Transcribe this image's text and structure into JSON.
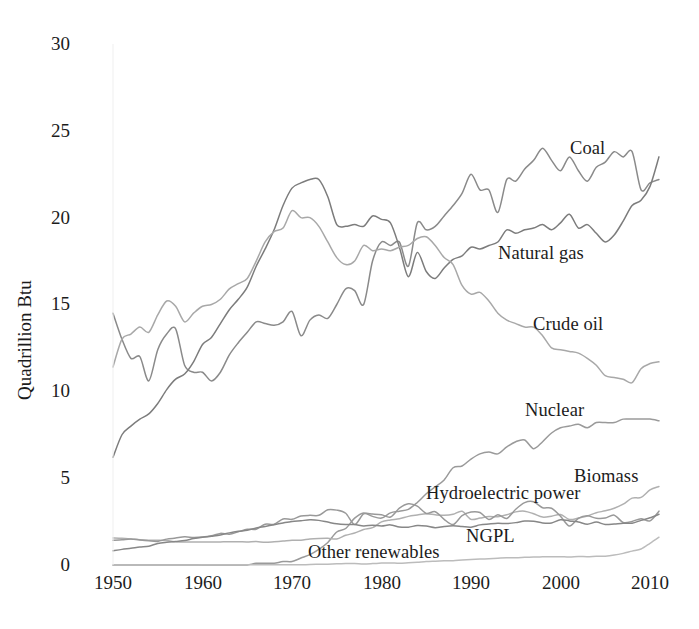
{
  "chart_data": {
    "type": "line",
    "title": "",
    "xlabel": "",
    "ylabel": "Quadrillion Btu",
    "xlim": [
      1950,
      2011
    ],
    "ylim": [
      0,
      30
    ],
    "xticks": [
      1950,
      1960,
      1970,
      1980,
      1990,
      2000,
      2010
    ],
    "yticks": [
      0,
      5,
      10,
      15,
      20,
      25,
      30
    ],
    "grid": false,
    "legend_position": "inline-annotations",
    "x": [
      1950,
      1951,
      1952,
      1953,
      1954,
      1955,
      1956,
      1957,
      1958,
      1959,
      1960,
      1961,
      1962,
      1963,
      1964,
      1965,
      1966,
      1967,
      1968,
      1969,
      1970,
      1971,
      1972,
      1973,
      1974,
      1975,
      1976,
      1977,
      1978,
      1979,
      1980,
      1981,
      1982,
      1983,
      1984,
      1985,
      1986,
      1987,
      1988,
      1989,
      1990,
      1991,
      1992,
      1993,
      1994,
      1995,
      1996,
      1997,
      1998,
      1999,
      2000,
      2001,
      2002,
      2003,
      2004,
      2005,
      2006,
      2007,
      2008,
      2009,
      2010,
      2011
    ],
    "series": [
      {
        "name": "Coal",
        "color": "#8a8a8a",
        "label_x": 1996,
        "label_y": 24.2,
        "values": [
          14.5,
          13.0,
          11.9,
          12.0,
          10.6,
          12.4,
          13.3,
          13.6,
          11.5,
          11.1,
          11.1,
          10.6,
          11.1,
          12.1,
          12.8,
          13.4,
          14.0,
          13.9,
          13.8,
          14.0,
          14.6,
          13.2,
          14.1,
          14.4,
          14.2,
          15.0,
          15.9,
          15.8,
          15.0,
          17.5,
          18.6,
          18.4,
          18.6,
          17.2,
          19.7,
          19.3,
          19.5,
          20.1,
          20.7,
          21.4,
          22.5,
          21.6,
          21.6,
          20.3,
          22.2,
          22.1,
          22.8,
          23.3,
          24.0,
          23.3,
          22.7,
          23.5,
          22.7,
          22.1,
          22.9,
          23.2,
          23.8,
          23.5,
          23.8,
          21.6,
          22.0,
          22.2
        ]
      },
      {
        "name": "Natural gas",
        "color": "#7c7c7c",
        "label_x": 1993,
        "label_y": 19.0,
        "values": [
          6.2,
          7.5,
          8.0,
          8.4,
          8.7,
          9.3,
          10.1,
          10.7,
          11.0,
          11.7,
          12.7,
          13.1,
          13.9,
          14.7,
          15.3,
          16.0,
          17.2,
          18.2,
          19.3,
          20.7,
          21.7,
          22.0,
          22.2,
          22.2,
          21.2,
          19.6,
          19.5,
          19.6,
          19.5,
          20.1,
          19.9,
          19.7,
          18.3,
          16.6,
          18.0,
          16.9,
          16.5,
          17.1,
          17.6,
          17.8,
          18.3,
          18.2,
          18.4,
          18.6,
          19.3,
          19.1,
          19.3,
          19.4,
          19.6,
          19.3,
          19.7,
          20.2,
          19.4,
          19.6,
          19.1,
          18.6,
          19.0,
          19.8,
          20.7,
          21.0,
          21.8,
          23.5
        ]
      },
      {
        "name": "Crude oil",
        "color": "#a8a8a8",
        "label_x": 1992,
        "label_y": 13.5,
        "values": [
          11.4,
          13.0,
          13.3,
          13.7,
          13.4,
          14.4,
          15.2,
          14.9,
          14.0,
          14.5,
          14.9,
          15.0,
          15.3,
          15.9,
          16.2,
          16.5,
          17.5,
          18.6,
          19.2,
          19.4,
          20.4,
          20.0,
          20.0,
          19.5,
          18.6,
          17.7,
          17.3,
          17.5,
          18.4,
          18.1,
          18.2,
          18.1,
          18.3,
          18.4,
          18.8,
          18.9,
          18.4,
          17.7,
          17.3,
          16.1,
          15.6,
          15.7,
          15.2,
          14.5,
          14.1,
          13.9,
          13.7,
          13.7,
          13.2,
          12.5,
          12.4,
          12.3,
          12.2,
          11.9,
          11.5,
          10.9,
          10.8,
          10.7,
          10.5,
          11.3,
          11.6,
          11.7
        ]
      },
      {
        "name": "Nuclear",
        "color": "#9a9a9a",
        "label_x": 1991,
        "label_y": 9.5,
        "values": [
          0.0,
          0.0,
          0.0,
          0.0,
          0.0,
          0.0,
          0.0,
          0.0,
          0.0,
          0.0,
          0.0,
          0.0,
          0.0,
          0.0,
          0.0,
          0.0,
          0.1,
          0.1,
          0.1,
          0.2,
          0.2,
          0.4,
          0.6,
          0.9,
          1.3,
          1.9,
          2.1,
          2.7,
          3.0,
          2.8,
          2.7,
          3.0,
          3.1,
          3.2,
          3.6,
          4.1,
          4.5,
          4.9,
          5.6,
          5.7,
          6.1,
          6.4,
          6.5,
          6.4,
          6.8,
          7.1,
          7.2,
          6.7,
          7.1,
          7.6,
          7.9,
          8.0,
          8.1,
          7.9,
          8.2,
          8.2,
          8.2,
          8.4,
          8.4,
          8.4,
          8.4,
          8.3
        ]
      },
      {
        "name": "Biomass",
        "color": "#b0b0b0",
        "label_x": 2001,
        "label_y": 5.4,
        "values": [
          1.56,
          1.54,
          1.5,
          1.45,
          1.42,
          1.42,
          1.41,
          1.34,
          1.32,
          1.32,
          1.32,
          1.32,
          1.33,
          1.34,
          1.34,
          1.33,
          1.35,
          1.31,
          1.34,
          1.38,
          1.43,
          1.43,
          1.5,
          1.53,
          1.54,
          1.5,
          1.71,
          1.84,
          2.04,
          2.15,
          2.48,
          2.59,
          2.66,
          2.8,
          2.88,
          2.95,
          2.89,
          2.86,
          2.92,
          3.09,
          2.63,
          2.7,
          2.79,
          2.78,
          2.89,
          3.06,
          3.1,
          2.95,
          2.76,
          2.81,
          2.91,
          2.62,
          2.7,
          2.82,
          3.01,
          3.12,
          3.27,
          3.5,
          3.85,
          3.89,
          4.32,
          4.52
        ]
      },
      {
        "name": "Hydroelectric power",
        "color": "#999999",
        "label_x": 1981,
        "label_y": 4.6,
        "values": [
          1.42,
          1.45,
          1.5,
          1.44,
          1.39,
          1.36,
          1.49,
          1.55,
          1.62,
          1.59,
          1.61,
          1.68,
          1.82,
          1.77,
          1.91,
          2.06,
          2.06,
          2.35,
          2.35,
          2.65,
          2.63,
          2.82,
          2.86,
          2.86,
          3.18,
          3.16,
          2.98,
          2.33,
          2.94,
          2.93,
          2.9,
          2.76,
          3.27,
          3.53,
          3.39,
          2.97,
          3.07,
          2.63,
          2.33,
          2.84,
          3.05,
          3.02,
          2.62,
          2.89,
          2.68,
          3.21,
          3.59,
          3.64,
          3.3,
          3.27,
          2.81,
          2.24,
          2.69,
          2.83,
          2.69,
          2.7,
          2.87,
          2.45,
          2.51,
          2.67,
          2.54,
          3.1
        ]
      },
      {
        "name": "NGPL",
        "color": "#878787",
        "label_x": 1985,
        "label_y": 1.4,
        "values": [
          0.82,
          0.9,
          0.96,
          1.03,
          1.08,
          1.24,
          1.31,
          1.36,
          1.41,
          1.52,
          1.6,
          1.66,
          1.73,
          1.85,
          1.94,
          2.0,
          2.13,
          2.22,
          2.32,
          2.42,
          2.51,
          2.55,
          2.6,
          2.57,
          2.47,
          2.37,
          2.33,
          2.33,
          2.25,
          2.29,
          2.25,
          2.31,
          2.19,
          2.18,
          2.27,
          2.24,
          2.15,
          2.22,
          2.26,
          2.22,
          2.18,
          2.31,
          2.36,
          2.4,
          2.39,
          2.44,
          2.53,
          2.52,
          2.42,
          2.42,
          2.61,
          2.54,
          2.48,
          2.35,
          2.47,
          2.33,
          2.36,
          2.4,
          2.41,
          2.57,
          2.72,
          2.92
        ]
      },
      {
        "name": "Other renewables",
        "color": "#bcbcbc",
        "label_x": 1976,
        "label_y": 0.6,
        "values": [
          0.0,
          0.0,
          0.0,
          0.0,
          0.0,
          0.0,
          0.0,
          0.0,
          0.0,
          0.0,
          0.01,
          0.01,
          0.01,
          0.01,
          0.01,
          0.01,
          0.01,
          0.01,
          0.01,
          0.01,
          0.01,
          0.01,
          0.03,
          0.04,
          0.05,
          0.07,
          0.08,
          0.08,
          0.06,
          0.08,
          0.11,
          0.12,
          0.1,
          0.13,
          0.16,
          0.2,
          0.22,
          0.24,
          0.25,
          0.29,
          0.32,
          0.34,
          0.36,
          0.39,
          0.42,
          0.42,
          0.44,
          0.46,
          0.47,
          0.48,
          0.48,
          0.46,
          0.49,
          0.48,
          0.5,
          0.51,
          0.57,
          0.67,
          0.8,
          0.92,
          1.25,
          1.6
        ]
      }
    ]
  },
  "axes": {
    "ylabel": "Quadrillion Btu",
    "ytick_labels": [
      "30",
      "25",
      "20",
      "15",
      "10",
      "5",
      "0"
    ],
    "xtick_labels": [
      "1950",
      "1960",
      "1970",
      "1980",
      "1990",
      "2000",
      "2010"
    ]
  },
  "annotations": {
    "coal": "Coal",
    "natural_gas": "Natural gas",
    "crude_oil": "Crude oil",
    "nuclear": "Nuclear",
    "biomass": "Biomass",
    "hydroelectric": "Hydroelectric power",
    "ngpl": "NGPL",
    "other_renewables": "Other renewables"
  }
}
